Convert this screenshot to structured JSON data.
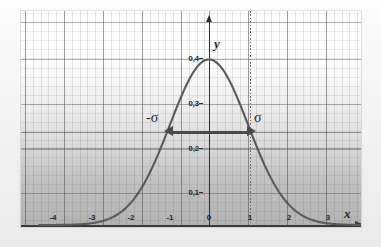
{
  "figure": {
    "axis_labels": {
      "x": "x",
      "y": "y"
    },
    "y_ticks": [
      {
        "label": "0,4",
        "value": 0.4
      },
      {
        "label": "0,3",
        "value": 0.3
      },
      {
        "label": "0,2",
        "value": 0.2
      },
      {
        "label": "0,1",
        "value": 0.1
      }
    ],
    "x_ticks": [
      {
        "label": "-4",
        "value": -4
      },
      {
        "label": "-3",
        "value": -3
      },
      {
        "label": "-2",
        "value": -2
      },
      {
        "label": "-1",
        "value": -1
      },
      {
        "label": "0",
        "value": 0
      },
      {
        "label": "1",
        "value": 1
      },
      {
        "label": "2",
        "value": 2
      },
      {
        "label": "3",
        "value": 3
      },
      {
        "label": "4",
        "value": 4
      }
    ],
    "annotations": {
      "sigma_left": "-σ",
      "sigma_right": "σ"
    },
    "colors": {
      "curve": "#5a5a5a",
      "axis": "#2e2e2e",
      "arrow": "#4a4a4a",
      "grid_major": "#505050",
      "grid_minor": "#6e6e6e",
      "dotted_marker": "#6b6b6b"
    }
  },
  "chart_data": {
    "type": "line",
    "title": "",
    "xlabel": "x",
    "ylabel": "y",
    "xlim": [
      -4.35,
      4.45
    ],
    "ylim": [
      0,
      0.44
    ],
    "grid": true,
    "legend": false,
    "series": [
      {
        "name": "standard normal density",
        "function": "y = (1/sqrt(2*pi)) * exp(-x^2/2)",
        "x": [
          -4.3,
          -4.0,
          -3.5,
          -3.0,
          -2.5,
          -2.0,
          -1.5,
          -1.0,
          -0.5,
          0.0,
          0.5,
          1.0,
          1.5,
          2.0,
          2.5,
          3.0,
          3.5,
          4.0,
          4.3
        ],
        "y": [
          0.0,
          0.0001,
          0.0009,
          0.0044,
          0.0175,
          0.054,
          0.1295,
          0.242,
          0.3521,
          0.3989,
          0.3521,
          0.242,
          0.1295,
          0.054,
          0.0175,
          0.0044,
          0.0009,
          0.0001,
          0.0
        ]
      }
    ],
    "annotations": [
      {
        "text": "-σ",
        "x": -1,
        "y": 0.24,
        "type": "arrow-endpoint-label"
      },
      {
        "text": "σ",
        "x": 1,
        "y": 0.24,
        "type": "arrow-endpoint-label"
      },
      {
        "text": "",
        "type": "double-arrow",
        "x_from": -1,
        "x_to": 1,
        "y": 0.24
      },
      {
        "text": "",
        "type": "vertical-dotted-line",
        "x": 1
      }
    ]
  }
}
